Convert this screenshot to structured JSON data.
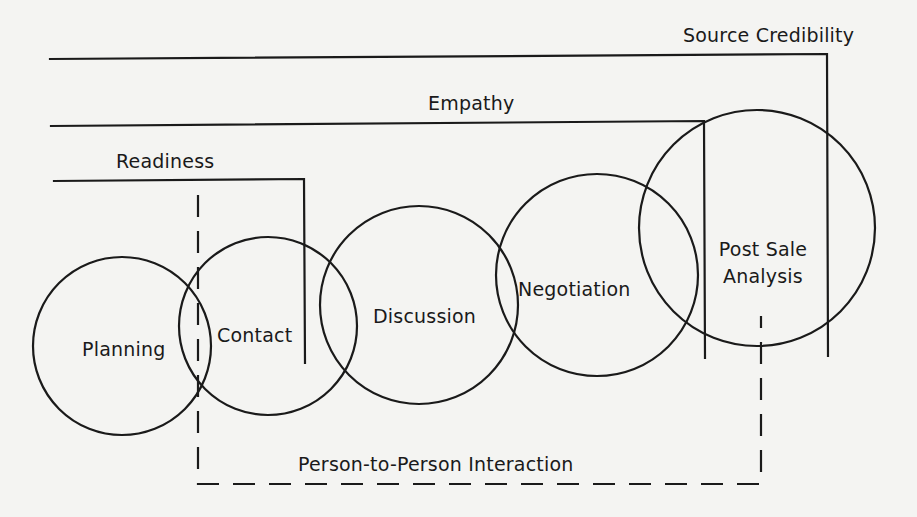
{
  "diagram": {
    "type": "sales-process-overlapping-stages",
    "colors": {
      "background": "#f4f4f2",
      "stroke": "#1a1a1a",
      "text": "#1a1a1a"
    },
    "brackets": [
      {
        "id": "source-credibility",
        "label": "Source Credibility",
        "style": "solid"
      },
      {
        "id": "empathy",
        "label": "Empathy",
        "style": "solid"
      },
      {
        "id": "readiness",
        "label": "Readiness",
        "style": "solid"
      },
      {
        "id": "person-to-person",
        "label": "Person-to-Person Interaction",
        "style": "dashed"
      }
    ],
    "stages": [
      {
        "id": "planning",
        "label": "Planning"
      },
      {
        "id": "contact",
        "label": "Contact"
      },
      {
        "id": "discussion",
        "label": "Discussion"
      },
      {
        "id": "negotiation",
        "label": "Negotiation"
      },
      {
        "id": "post-sale-analysis",
        "label_line1": "Post Sale",
        "label_line2": "Analysis"
      }
    ]
  }
}
